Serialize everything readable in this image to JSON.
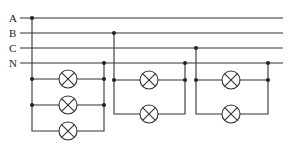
{
  "diagram": {
    "title": "",
    "type": "three-phase four-wire lamp circuit",
    "lines": [
      {
        "label": "A",
        "y": 18
      },
      {
        "label": "B",
        "y": 33
      },
      {
        "label": "C",
        "y": 48
      },
      {
        "label": "N",
        "y": 63
      }
    ],
    "groups": [
      {
        "phase": "A",
        "lamp_count": 3
      },
      {
        "phase": "B",
        "lamp_count": 2
      },
      {
        "phase": "C",
        "lamp_count": 2
      }
    ],
    "lamp_icon": "lamp-cross-circle",
    "colors": {
      "stroke": "#333333",
      "background": "#ffffff"
    }
  }
}
